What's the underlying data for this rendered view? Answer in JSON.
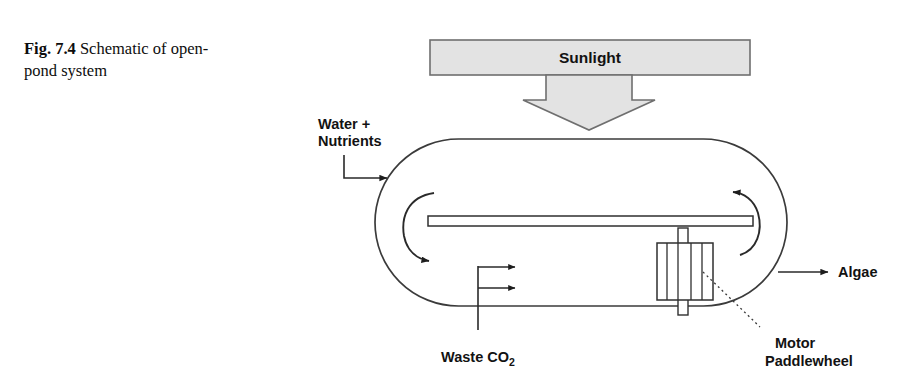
{
  "figure": {
    "caption_number": "Fig. 7.4",
    "caption_text": "Schematic of open-pond system"
  },
  "diagram": {
    "title": "Schematic of open-pond system",
    "banner": {
      "label": "Sunlight",
      "fill_color": "#e3e3e3",
      "stroke_color": "#6b6b6b"
    },
    "labels": {
      "water_nutrients_line1": "Water +",
      "water_nutrients_line2": "Nutrients",
      "algae": "Algae",
      "waste_co2_main": "Waste CO",
      "waste_co2_sub": "2",
      "motor": "Motor",
      "paddlewheel": "Paddlewheel"
    },
    "components": {
      "pond": "open-pond raceway",
      "divider": "center divider wall",
      "paddlewheel": "paddlewheel",
      "shaft": "paddlewheel shaft",
      "left_circulation": "left circulation arrow",
      "right_circulation": "right circulation arrow",
      "co2_sparger_arrows": 2
    },
    "colors": {
      "ink": "#121212",
      "line": "#3b3b3b",
      "background": "#ffffff"
    }
  }
}
